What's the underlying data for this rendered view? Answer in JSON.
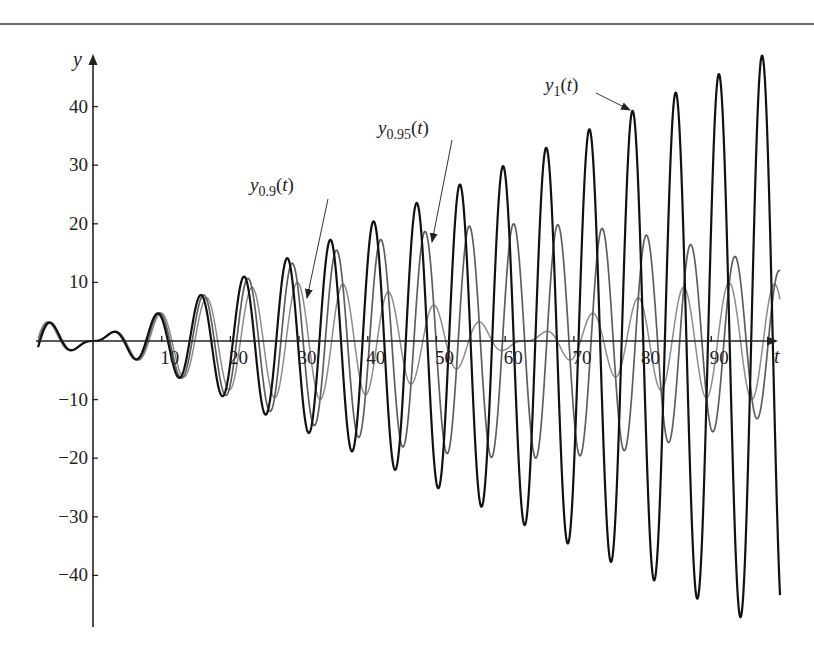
{
  "chart_data": {
    "type": "line",
    "title": "",
    "xlabel": "t",
    "ylabel": "y",
    "xlim": [
      -8,
      100
    ],
    "ylim": [
      -50,
      50
    ],
    "grid": false,
    "legend": "none (curves labeled by arrow annotations)",
    "x_ticks": [
      10,
      20,
      30,
      40,
      50,
      60,
      70,
      80,
      90
    ],
    "y_ticks": [
      -40,
      -30,
      -20,
      -10,
      10,
      20,
      30,
      40
    ],
    "x_tick_labels": [
      "10",
      "20",
      "30",
      "40",
      "50",
      "60",
      "70",
      "80",
      "90"
    ],
    "y_tick_labels": [
      "−40",
      "−30",
      "−20",
      "−10",
      "10",
      "20",
      "30",
      "40"
    ],
    "series": [
      {
        "name": "y1(t)",
        "omega": 1.0,
        "formula": "(sin t - t cos t)/2",
        "color": "#111111",
        "width": 2.2,
        "sample_t": [
          -8,
          0,
          10,
          20,
          30,
          40,
          50,
          60,
          70,
          78.5,
          90,
          94.2,
          100
        ],
        "sample_y": [
          -0.1,
          0,
          4.5,
          -3.7,
          -13.8,
          12.9,
          24.8,
          -28.6,
          11.0,
          39.3,
          20.1,
          -47.0,
          -43.4
        ]
      },
      {
        "name": "y0.95(t)",
        "omega": 0.95,
        "formula": "(sin 0.95t - 0.95 sin t)/(1 - 0.95^2)",
        "color": "#5e5e5e",
        "width": 1.7,
        "envelope_max": 20.5,
        "envelope_max_at_t": 63
      },
      {
        "name": "y0.9(t)",
        "omega": 0.9,
        "formula": "(sin 0.9t - 0.9 sin t)/(1 - 0.9^2)",
        "color": "#8c8c8c",
        "width": 1.5,
        "envelope_max": 10.5,
        "envelope_max_at_t": 31,
        "envelope_zero_at_t": 62.8
      }
    ],
    "annotations": [
      {
        "label": "y1(t)",
        "text_main": "y",
        "text_sub": "1",
        "text_tail": "(t)",
        "points_to_t": 78.5,
        "points_to_y": 39
      },
      {
        "label": "y0.95(t)",
        "text_main": "y",
        "text_sub": "0.95",
        "text_tail": "(t)",
        "points_to_t": 49,
        "points_to_y": 17
      },
      {
        "label": "y0.9(t)",
        "text_main": "y",
        "text_sub": "0.9",
        "text_tail": "(t)",
        "points_to_t": 31,
        "points_to_y": 7
      }
    ]
  },
  "layout": {
    "origin_px": [
      93,
      341
    ],
    "px_per_t": 6.87,
    "px_per_y": 5.86,
    "x_axis_end_px": 778,
    "y_axis_top_px": 54,
    "y_axis_bottom_px": 627
  }
}
